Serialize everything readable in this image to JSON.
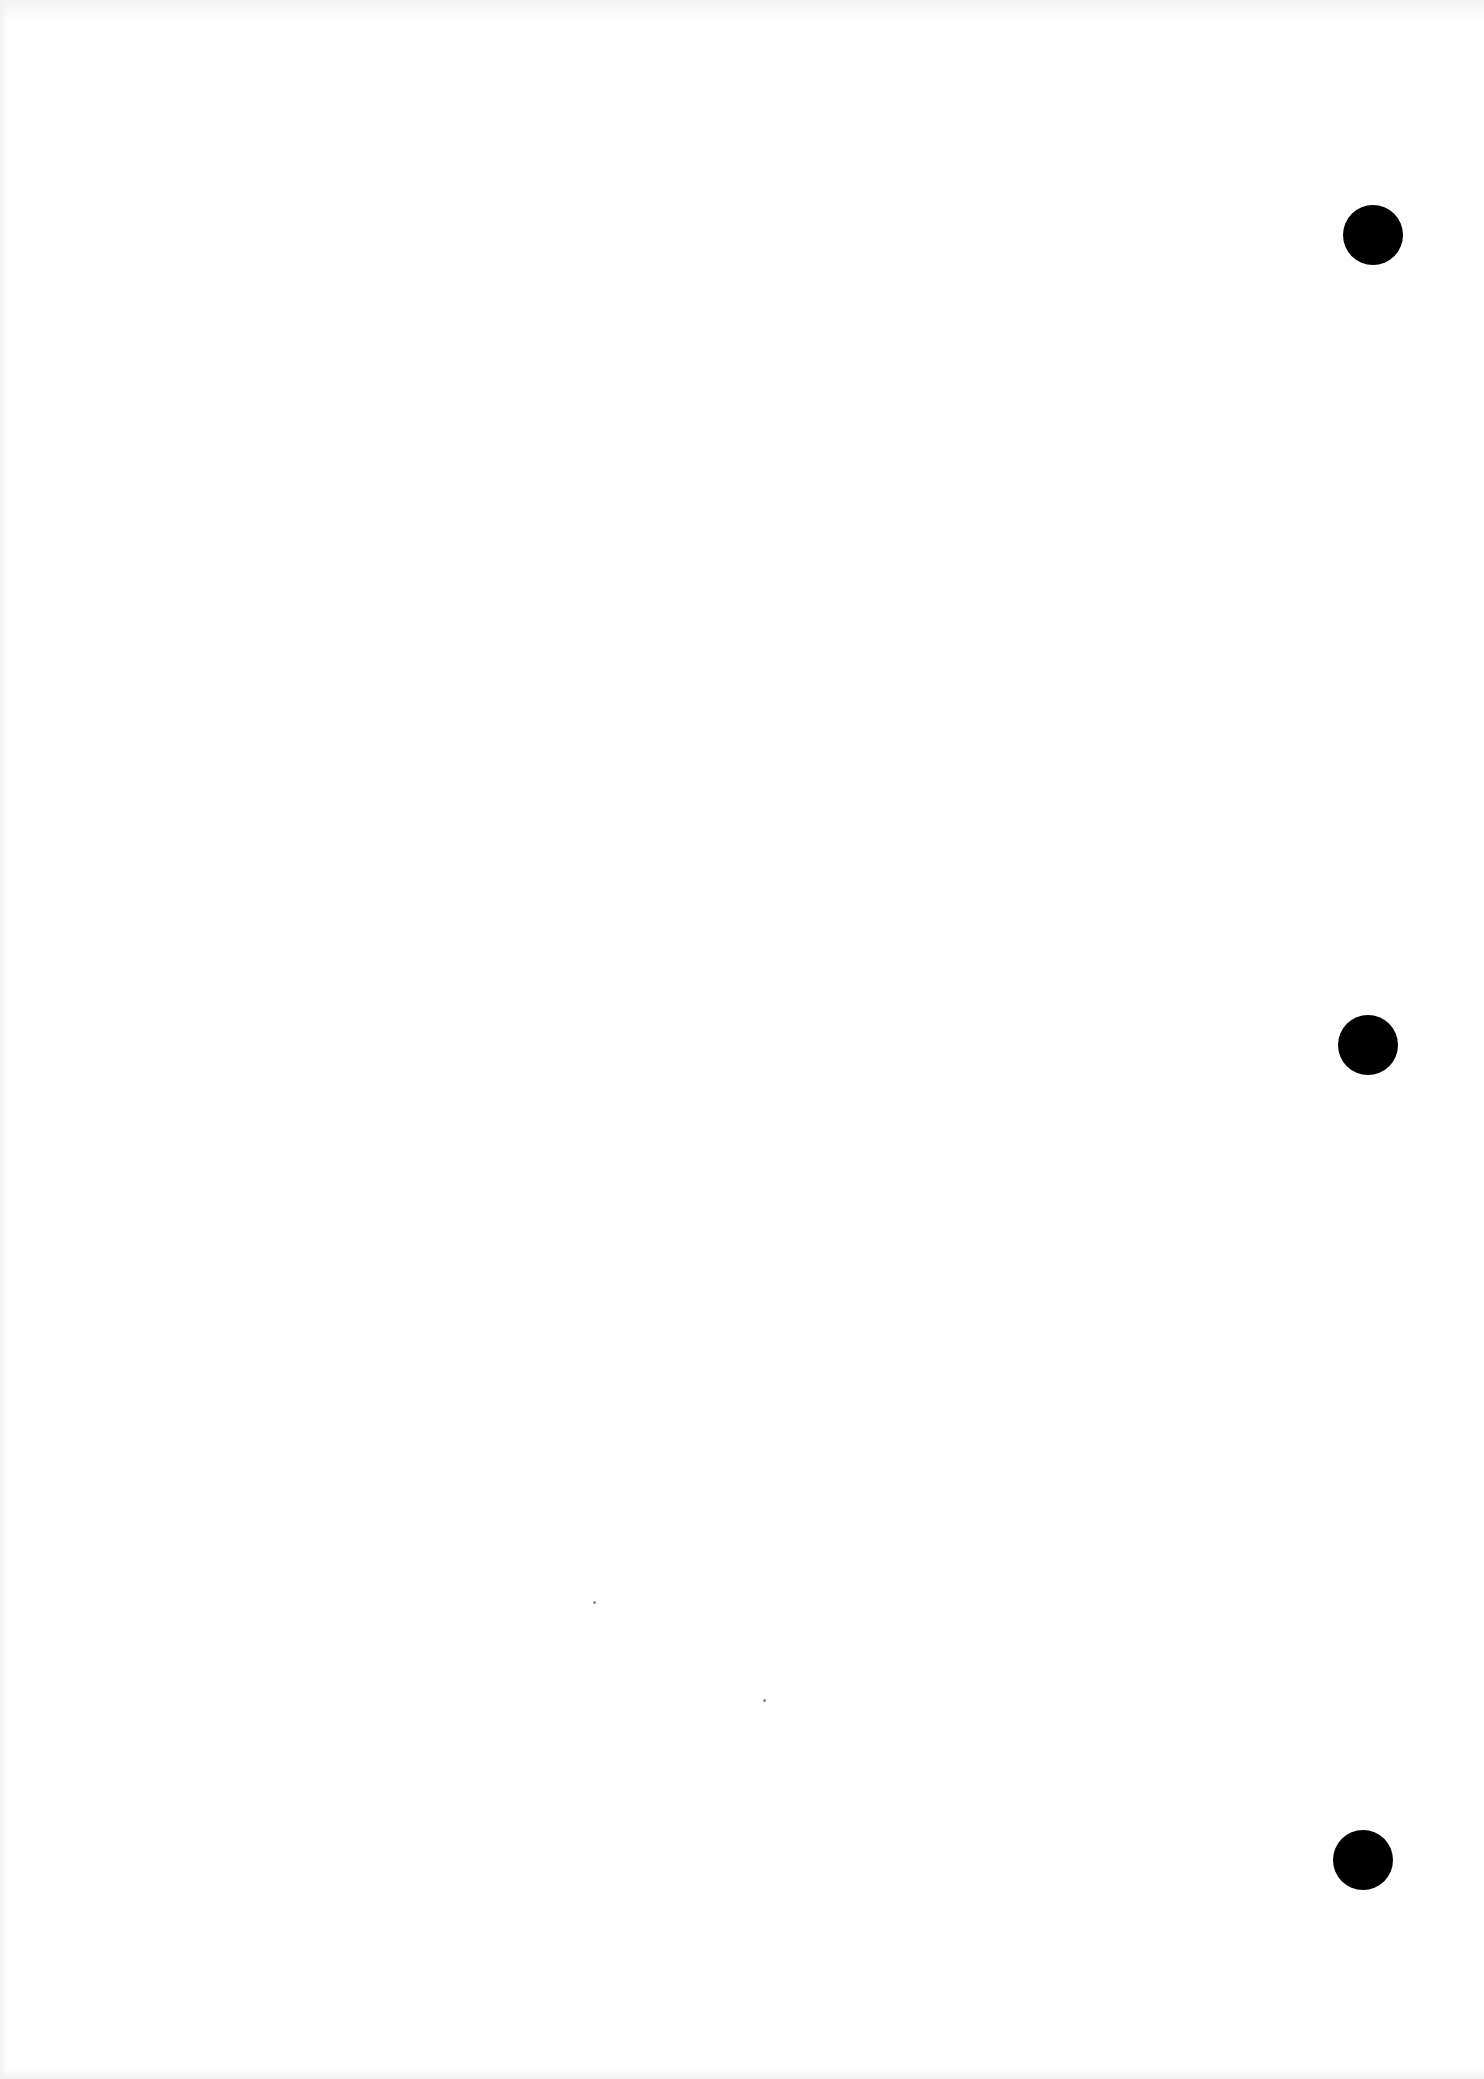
{
  "document": {
    "type": "blank scanned page",
    "background_color": "#fefefe",
    "punch_holes": [
      {
        "cx": 1373,
        "cy": 235,
        "d": 60
      },
      {
        "cx": 1368,
        "cy": 1045,
        "d": 60
      },
      {
        "cx": 1363,
        "cy": 1860,
        "d": 60
      }
    ],
    "hole_color": "#000000"
  }
}
